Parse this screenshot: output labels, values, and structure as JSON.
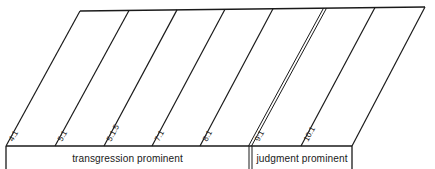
{
  "diagram": {
    "ratios": [
      {
        "label": "4:1",
        "bottom_x": 6,
        "top_x": 80,
        "double": false
      },
      {
        "label": "5:1",
        "bottom_x": 55,
        "top_x": 129,
        "double": false
      },
      {
        "label": "5:1.5",
        "bottom_x": 104,
        "top_x": 177,
        "double": false
      },
      {
        "label": "7:1",
        "bottom_x": 152,
        "top_x": 225,
        "double": false
      },
      {
        "label": "8:1",
        "bottom_x": 200,
        "top_x": 273,
        "double": false
      },
      {
        "label": "9:1",
        "bottom_x": 250,
        "top_x": 325,
        "double": true
      },
      {
        "label": "10:1",
        "bottom_x": 301,
        "top_x": 375,
        "double": false
      },
      {
        "label": "",
        "bottom_x": 352,
        "top_x": 425,
        "double": false
      }
    ],
    "regions": [
      {
        "label": "transgression prominent"
      },
      {
        "label": "judgment prominent"
      }
    ],
    "colors": {
      "line": "#1a1a1a",
      "background": "#ffffff"
    }
  }
}
